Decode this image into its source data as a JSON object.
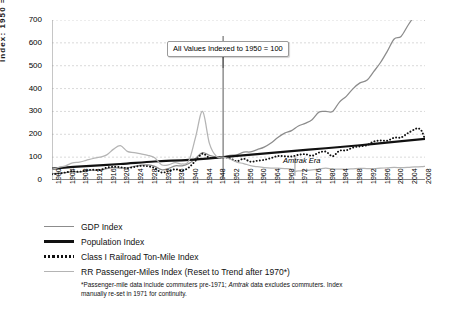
{
  "chart_data": {
    "type": "line",
    "title": "",
    "xlabel": "",
    "ylabel": "Index: 1950 = 100",
    "ylim": [
      0,
      700
    ],
    "xlim": [
      1900,
      2009
    ],
    "ytick_step": 100,
    "yticks": [
      "0",
      "100",
      "200",
      "300",
      "400",
      "500",
      "600",
      "700"
    ],
    "xticks": [
      "1900",
      "1904",
      "1908",
      "1912",
      "1916",
      "1920",
      "1924",
      "1928",
      "1932",
      "1936",
      "1940",
      "1944",
      "1948",
      "1952",
      "1956",
      "1960",
      "1964",
      "1968",
      "1972",
      "1976",
      "1980",
      "1984",
      "1988",
      "1992",
      "1996",
      "2000",
      "2004",
      "2008"
    ],
    "grid": "horizontal-dashed",
    "legend_position": "below-left",
    "annotations": [
      {
        "name": "index-note",
        "text": "All Values Indexed to 1950 = 100",
        "x": 1950,
        "y": 560
      },
      {
        "name": "amtrak-era",
        "text": "Amtrak Era",
        "x": 1971,
        "y": 95
      }
    ],
    "series": [
      {
        "name": "GDP Index",
        "color": "#8c8c8c",
        "style": "solid",
        "x": [
          1900,
          1902,
          1904,
          1906,
          1908,
          1910,
          1912,
          1914,
          1916,
          1918,
          1920,
          1922,
          1924,
          1926,
          1928,
          1930,
          1932,
          1934,
          1936,
          1938,
          1940,
          1942,
          1944,
          1946,
          1948,
          1950,
          1952,
          1954,
          1956,
          1958,
          1960,
          1962,
          1964,
          1966,
          1968,
          1970,
          1972,
          1974,
          1976,
          1978,
          1980,
          1982,
          1984,
          1986,
          1988,
          1990,
          1992,
          1994,
          1996,
          1998,
          2000,
          2002,
          2004,
          2006,
          2007,
          2008,
          2009
        ],
        "values": [
          27,
          30,
          32,
          37,
          35,
          41,
          43,
          42,
          50,
          54,
          52,
          53,
          60,
          65,
          66,
          60,
          45,
          50,
          62,
          62,
          72,
          95,
          120,
          108,
          101,
          100,
          108,
          110,
          122,
          123,
          133,
          144,
          162,
          186,
          205,
          216,
          236,
          248,
          264,
          297,
          300,
          300,
          341,
          366,
          400,
          425,
          436,
          474,
          514,
          564,
          617,
          628,
          676,
          720,
          736,
          726,
          700
        ]
      },
      {
        "name": "Population Index",
        "color": "#111111",
        "style": "solid-thick",
        "x": [
          1900,
          1910,
          1920,
          1930,
          1940,
          1950,
          1960,
          1970,
          1980,
          1990,
          2000,
          2009
        ],
        "values": [
          50,
          61,
          70,
          81,
          88,
          100,
          113,
          126,
          139,
          152,
          167,
          180
        ]
      },
      {
        "name": "Class I Railroad Ton-Mile Index",
        "color": "#111111",
        "style": "dotted",
        "x": [
          1900,
          1902,
          1904,
          1906,
          1908,
          1910,
          1912,
          1914,
          1916,
          1918,
          1920,
          1922,
          1924,
          1926,
          1928,
          1930,
          1932,
          1934,
          1936,
          1938,
          1940,
          1942,
          1944,
          1946,
          1948,
          1950,
          1952,
          1954,
          1956,
          1958,
          1960,
          1962,
          1964,
          1966,
          1968,
          1970,
          1972,
          1974,
          1976,
          1978,
          1980,
          1982,
          1984,
          1986,
          1988,
          1990,
          1992,
          1994,
          1996,
          1998,
          2000,
          2002,
          2004,
          2006,
          2007,
          2008,
          2009
        ],
        "values": [
          25,
          28,
          33,
          38,
          36,
          42,
          45,
          44,
          54,
          58,
          56,
          52,
          57,
          62,
          60,
          52,
          33,
          38,
          47,
          41,
          55,
          85,
          115,
          97,
          98,
          100,
          95,
          82,
          93,
          80,
          84,
          88,
          96,
          105,
          104,
          103,
          110,
          113,
          106,
          120,
          124,
          104,
          128,
          130,
          142,
          147,
          152,
          168,
          173,
          172,
          185,
          186,
          205,
          222,
          226,
          215,
          178
        ]
      },
      {
        "name": "RR Passenger-Miles Index (Reset to Trend after 1970*)",
        "color": "#b4b4b4",
        "style": "solid",
        "x": [
          1900,
          1902,
          1904,
          1906,
          1908,
          1910,
          1912,
          1914,
          1916,
          1918,
          1920,
          1922,
          1924,
          1926,
          1928,
          1930,
          1932,
          1934,
          1936,
          1938,
          1940,
          1942,
          1944,
          1946,
          1948,
          1950,
          1952,
          1954,
          1956,
          1958,
          1960,
          1962,
          1964,
          1966,
          1968,
          1970,
          1971,
          1972,
          1974,
          1976,
          1978,
          1980,
          1982,
          1984,
          1986,
          1988,
          1990,
          1992,
          1994,
          1996,
          1998,
          2000,
          2002,
          2004,
          2006,
          2008,
          2009
        ],
        "values": [
          48,
          55,
          62,
          75,
          78,
          86,
          94,
          100,
          110,
          135,
          150,
          125,
          120,
          114,
          108,
          97,
          67,
          66,
          76,
          70,
          84,
          190,
          300,
          160,
          104,
          100,
          92,
          78,
          72,
          63,
          58,
          54,
          52,
          52,
          50,
          47,
          38,
          40,
          42,
          44,
          48,
          52,
          48,
          48,
          47,
          49,
          51,
          50,
          50,
          52,
          53,
          55,
          54,
          55,
          57,
          58,
          60
        ]
      }
    ]
  },
  "legend": {
    "items": [
      {
        "label": "GDP Index",
        "swatch": "sw-gdp"
      },
      {
        "label": "Population Index",
        "swatch": "sw-pop"
      },
      {
        "label": "Class I Railroad Ton-Mile Index",
        "swatch": "sw-rail"
      },
      {
        "label": "RR Passenger-Miles Index (Reset to Trend after 1970*)",
        "swatch": "sw-pass"
      }
    ]
  },
  "footnote": {
    "part1": "*Passenger-mile data include commuters pre-1971; ",
    "emphasis": "Amtrak",
    "part2": " data excludes commuters. Index manually re-set in 1971 for continuity."
  }
}
